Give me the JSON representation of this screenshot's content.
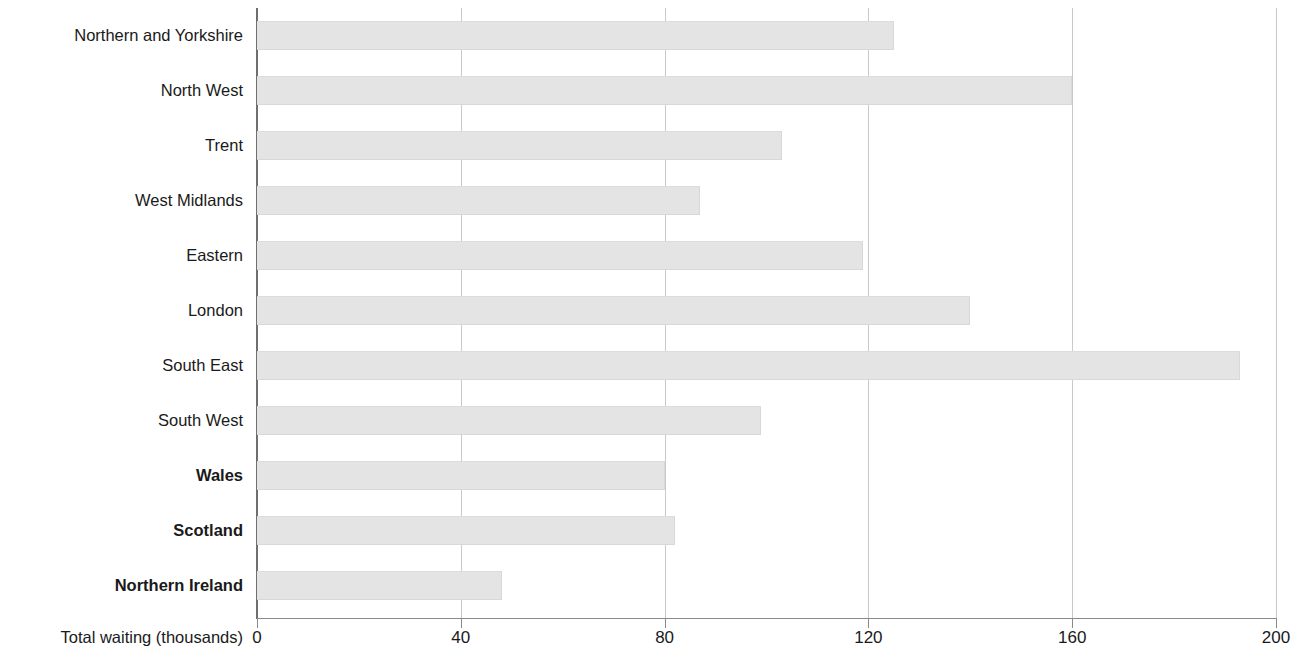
{
  "chart_data": {
    "type": "bar",
    "orientation": "horizontal",
    "title": "",
    "xlabel": "Total waiting (thousands)",
    "ylabel": "",
    "xlim": [
      0,
      200
    ],
    "xticks": [
      0,
      40,
      80,
      120,
      160,
      200
    ],
    "grid": "vertical",
    "legend": "none",
    "bar_color": "#e4e4e4",
    "categories": [
      "Northern and Yorkshire",
      "North West",
      "Trent",
      "West Midlands",
      "Eastern",
      "London",
      "South East",
      "South West",
      "Wales",
      "Scotland",
      "Northern Ireland"
    ],
    "values": [
      125,
      160,
      103,
      87,
      119,
      140,
      193,
      99,
      80,
      82,
      48
    ],
    "emphasized_categories": [
      "Wales",
      "Scotland",
      "Northern Ireland"
    ]
  },
  "axis": {
    "x_tick_labels": [
      "0",
      "40",
      "80",
      "120",
      "160",
      "200"
    ],
    "x_axis_title": "Total waiting (thousands)"
  }
}
